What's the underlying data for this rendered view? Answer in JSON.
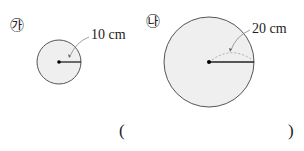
{
  "figures": [
    {
      "marker": "㉮",
      "radius_label": "10 cm",
      "cx": 59,
      "cy": 62,
      "r": 22
    },
    {
      "marker": "㉯",
      "radius_label": "20 cm",
      "cx": 209,
      "cy": 62,
      "r": 45
    }
  ],
  "answer": {
    "open": "(",
    "close": ")"
  },
  "colors": {
    "fill": "#f0f0f0",
    "stroke": "#444444"
  }
}
